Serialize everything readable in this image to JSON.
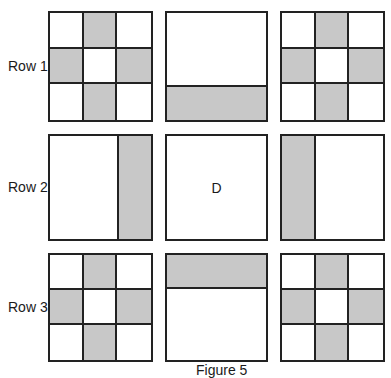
{
  "figure": {
    "caption": "Figure 5",
    "shade_color": "#c8c8c8",
    "rows": [
      {
        "label": "Row 1",
        "cells": [
          {
            "type": "cross",
            "pattern": [
              0,
              1,
              0,
              1,
              0,
              1,
              0,
              1,
              0
            ]
          },
          {
            "type": "band",
            "side": "bottom"
          },
          {
            "type": "cross",
            "pattern": [
              0,
              1,
              0,
              1,
              0,
              1,
              0,
              1,
              0
            ]
          }
        ]
      },
      {
        "label": "Row 2",
        "cells": [
          {
            "type": "band",
            "side": "right"
          },
          {
            "type": "missing",
            "label": "D"
          },
          {
            "type": "band",
            "side": "left"
          }
        ]
      },
      {
        "label": "Row 3",
        "cells": [
          {
            "type": "cross",
            "pattern": [
              0,
              1,
              0,
              1,
              0,
              1,
              0,
              1,
              0
            ]
          },
          {
            "type": "band",
            "side": "top"
          },
          {
            "type": "cross",
            "pattern": [
              0,
              1,
              0,
              1,
              0,
              1,
              0,
              1,
              0
            ]
          }
        ]
      }
    ]
  }
}
